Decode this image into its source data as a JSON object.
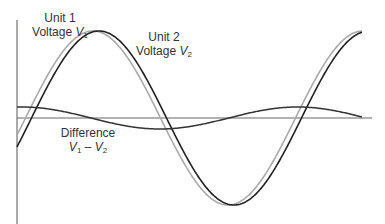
{
  "diagram": {
    "type": "waveform comparison",
    "labels": {
      "unit1": {
        "line1": "Unit 1",
        "line2_prefix": "Voltage ",
        "var": "V",
        "sub": "1"
      },
      "unit2": {
        "line1": "Unit 2",
        "line2_prefix": "Voltage ",
        "var": "V",
        "sub": "2"
      },
      "difference": {
        "line1": "Difference",
        "v1": "V",
        "v1_sub": "1",
        "minus": " – ",
        "v2": "V",
        "v2_sub": "2"
      }
    },
    "series": [
      {
        "name": "Unit 1 Voltage V1",
        "color": "#aaaaaa",
        "phase_px": 0,
        "amplitude_px": 87
      },
      {
        "name": "Unit 2 Voltage V2",
        "color": "#222222",
        "phase_px": 6,
        "amplitude_px": 87
      },
      {
        "name": "Difference V1 - V2",
        "color": "#333333",
        "amplitude_px": 11
      }
    ],
    "axes": {
      "color": "#555555"
    }
  }
}
